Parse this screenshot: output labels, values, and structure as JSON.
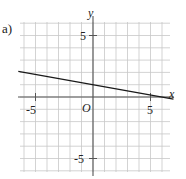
{
  "problem_label": "a)",
  "chart_data": {
    "type": "line",
    "title": "",
    "xlabel": "x",
    "ylabel": "y",
    "origin_label": "O",
    "xlim": [
      -6.5,
      7
    ],
    "ylim": [
      -6.5,
      6.5
    ],
    "grid": true,
    "x_tick_labels": [
      "-5",
      "5"
    ],
    "y_tick_labels": [
      "5",
      "-5"
    ],
    "series": [
      {
        "name": "line",
        "equation": "y = -x/6 + 1",
        "x": [
          -6.5,
          7
        ],
        "y": [
          2.08,
          -0.17
        ]
      }
    ]
  },
  "colors": {
    "grid": "#c8c8c8",
    "axis": "#555555",
    "line": "#1a1a1a",
    "text": "#222222"
  }
}
